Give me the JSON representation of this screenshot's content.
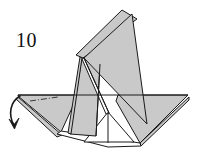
{
  "figure": {
    "kind": "origami-step-diagram",
    "step_label": "10",
    "caption": "",
    "palette": {
      "paper_front": "#c9c9c9",
      "paper_back": "#ffffff",
      "outline": "#1a1a1a",
      "crease": "#555555",
      "arrow": "#1a1a1a",
      "background": "#ffffff"
    },
    "arrows": [
      {
        "name": "fold-down-arrow",
        "direction": "down",
        "style": "curved-valley",
        "start": [
          21,
          96
        ],
        "end": [
          14,
          128
        ]
      }
    ],
    "crease_lines": [
      {
        "name": "dash-dot-crease",
        "style": "dash-dot",
        "points": [
          [
            31,
            101
          ],
          [
            57,
            97
          ]
        ]
      }
    ],
    "shapes": [
      {
        "name": "left-wing-panel",
        "fill": "paper_front",
        "points": [
          [
            18,
            95
          ],
          [
            76,
            95
          ],
          [
            60,
            131
          ],
          [
            19,
            96
          ]
        ]
      },
      {
        "name": "left-wing-underside",
        "fill": "paper_front",
        "points": [
          [
            19,
            97
          ],
          [
            62,
            134
          ],
          [
            58,
            136
          ],
          [
            18,
            98
          ]
        ]
      },
      {
        "name": "right-wing-panel",
        "fill": "paper_front",
        "points": [
          [
            118,
            95
          ],
          [
            188,
            95
          ],
          [
            139,
            142
          ],
          [
            118,
            100
          ]
        ]
      },
      {
        "name": "right-wing-underside",
        "fill": "paper_front",
        "points": [
          [
            139,
            142
          ],
          [
            188,
            96
          ],
          [
            188,
            99
          ],
          [
            140,
            145
          ]
        ]
      },
      {
        "name": "tall-flap-front",
        "fill": "paper_front",
        "points": [
          [
            132,
            14
          ],
          [
            146,
            123
          ],
          [
            84,
            58
          ]
        ]
      },
      {
        "name": "tall-flap-back",
        "fill": "paper_front",
        "points": [
          [
            122,
            10
          ],
          [
            136,
            18
          ],
          [
            82,
            57
          ],
          [
            76,
            55
          ]
        ]
      },
      {
        "name": "left-standing-flap",
        "fill": "paper_front",
        "points": [
          [
            82,
            57
          ],
          [
            71,
            133
          ],
          [
            95,
            133
          ],
          [
            98,
            62
          ]
        ]
      },
      {
        "name": "center-white-gusset",
        "fill": "paper_back",
        "points": [
          [
            108,
            112
          ],
          [
            133,
            141
          ],
          [
            86,
            141
          ]
        ]
      },
      {
        "name": "lower-base-band",
        "fill": "paper_back",
        "points": [
          [
            57,
            134
          ],
          [
            110,
            146
          ],
          [
            141,
            146
          ],
          [
            140,
            143
          ],
          [
            60,
            131
          ]
        ]
      }
    ],
    "outline_paths": [
      {
        "name": "horizon-line",
        "points": [
          [
            18,
            95
          ],
          [
            188,
            95
          ]
        ]
      },
      {
        "name": "flap-spine-line",
        "points": [
          [
            82,
            57
          ],
          [
            108,
            112
          ]
        ]
      },
      {
        "name": "gusset-center-line",
        "points": [
          [
            108,
            112
          ],
          [
            108,
            142
          ]
        ]
      }
    ]
  }
}
